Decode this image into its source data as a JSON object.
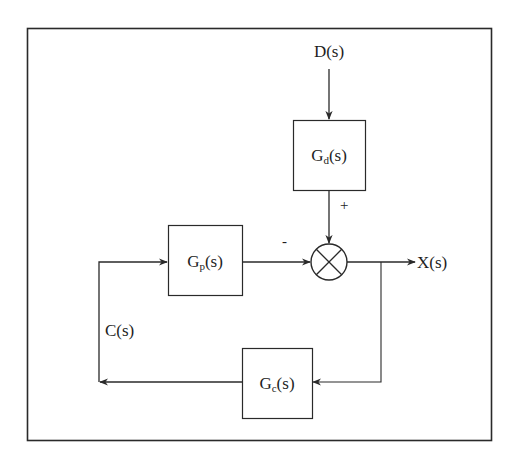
{
  "diagram": {
    "type": "control-system block diagram",
    "colors": {
      "line": "#2a2a2a",
      "background": "#ffffff"
    },
    "signals": {
      "disturbance": {
        "main": "D",
        "arg": "(s)"
      },
      "output": {
        "main": "X",
        "arg": "(s)"
      },
      "control": {
        "main": "C",
        "arg": "(s)"
      }
    },
    "blocks": {
      "disturbance_tf": {
        "main": "G",
        "sub": "d",
        "arg": "(s)"
      },
      "process_tf": {
        "main": "G",
        "sub": "p",
        "arg": "(s)"
      },
      "controller_tf": {
        "main": "G",
        "sub": "c",
        "arg": "(s)"
      }
    },
    "summing_junction": {
      "inputs": [
        {
          "from": "Gd(s)",
          "sign": "+"
        },
        {
          "from": "Gp(s)",
          "sign": "-"
        }
      ],
      "output": "X(s)"
    },
    "sign_labels": {
      "plus": "+",
      "minus": "-"
    },
    "connections": [
      [
        "D(s)",
        "Gd(s)"
      ],
      [
        "Gd(s)",
        "summing_junction"
      ],
      [
        "Gp(s)",
        "summing_junction"
      ],
      [
        "summing_junction",
        "X(s)"
      ],
      [
        "X(s)",
        "Gc(s)"
      ],
      [
        "Gc(s)",
        "C(s)"
      ],
      [
        "C(s)",
        "Gp(s)"
      ]
    ]
  }
}
